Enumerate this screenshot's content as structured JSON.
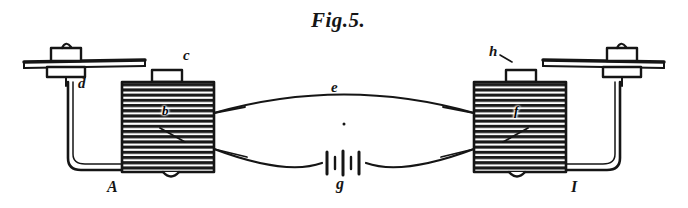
{
  "figure": {
    "title": "Fig.5.",
    "ink_color": "#151515",
    "background_color": "#ffffff"
  },
  "labels": {
    "left_assembly": "A",
    "right_assembly": "I",
    "left_armature_bar": "c",
    "right_armature_bar": "h",
    "left_binding_post": "d",
    "connecting_wire": "e",
    "battery": "g",
    "left_coil": "b",
    "right_coil": "f"
  },
  "parts": {
    "left_coil_name": "electromagnet-coil-left",
    "right_coil_name": "electromagnet-coil-right",
    "battery_name": "battery-symbol",
    "upper_wire_name": "upper-connecting-wire",
    "lower_wire_name": "lower-connecting-wire"
  }
}
